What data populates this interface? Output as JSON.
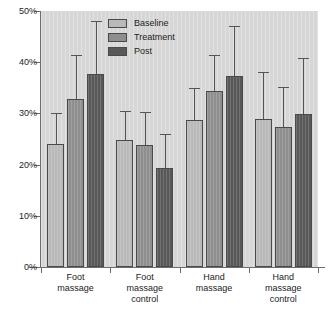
{
  "chart_data": {
    "type": "bar",
    "title": "",
    "xlabel": "",
    "ylabel": "",
    "ylim": [
      0,
      50
    ],
    "ytick_labels": [
      "0%",
      "10%",
      "20%",
      "30%",
      "40%",
      "50%"
    ],
    "ytick_values": [
      0,
      10,
      20,
      30,
      40,
      50
    ],
    "grid": false,
    "legend_position": "top-center",
    "error_bars": "upper-whisker",
    "categories": [
      "Foot massage",
      "Foot massage control",
      "Hand massage",
      "Hand massage control"
    ],
    "category_label_lines": [
      [
        "Foot",
        "massage"
      ],
      [
        "Foot",
        "massage",
        "control"
      ],
      [
        "Hand",
        "massage"
      ],
      [
        "Hand",
        "massage",
        "control"
      ]
    ],
    "series": [
      {
        "name": "Baseline",
        "color": "#b9b9b9",
        "values": [
          24.0,
          24.9,
          28.7,
          28.9
        ],
        "error_upper": [
          30.0,
          30.5,
          35.0,
          38.0
        ]
      },
      {
        "name": "Treatment",
        "color": "#8e8e8e",
        "values": [
          32.8,
          23.8,
          34.4,
          27.3
        ],
        "error_upper": [
          41.5,
          30.3,
          41.5,
          35.2
        ]
      },
      {
        "name": "Post",
        "color": "#585858",
        "values": [
          37.7,
          19.4,
          37.3,
          29.8
        ],
        "error_upper": [
          48.0,
          26.0,
          47.0,
          40.8
        ]
      }
    ]
  },
  "legend": {
    "items": [
      {
        "label": "Baseline"
      },
      {
        "label": "Treatment"
      },
      {
        "label": "Post"
      }
    ]
  },
  "colors": {
    "plot_background": "#d6d6d6",
    "axis": "#6d6d6d",
    "bar_border": "#4a4a4a",
    "error_bar": "#555555",
    "text": "#1c1c1c"
  }
}
